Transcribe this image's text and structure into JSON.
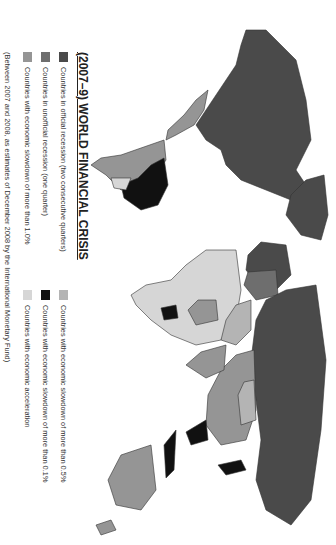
{
  "title": "(2007–9) WORLD FINANCIAL CRISIS",
  "orientation": "rotated 90° clockwise (north to the right)",
  "colors": {
    "official_recession": "#4a4a4a",
    "unofficial_recession": "#6e6e6e",
    "slowdown_1_0": "#959595",
    "slowdown_0_5": "#b4b4b4",
    "slowdown_0_1": "#111111",
    "acceleration": "#d6d6d6",
    "border": "#333333",
    "water": "#ffffff"
  },
  "legend": {
    "items": [
      {
        "label": "Countries in official recession (two consecutive quarters)",
        "color": "#4a4a4a"
      },
      {
        "label": "Countries in unofficial recession (one quarter)",
        "color": "#6e6e6e"
      },
      {
        "label": "Countries with economic slowdown of more than 1.0%",
        "color": "#959595"
      },
      {
        "label": "Countries with economic slowdown of more than 0.5%",
        "color": "#b4b4b4"
      },
      {
        "label": "Countries with economic slowdown of more than 0.1%",
        "color": "#111111"
      },
      {
        "label": "Countries with economic acceleration",
        "color": "#d6d6d6"
      }
    ],
    "note": "(Between 2007 and 2008, as estimates of December 2008 by the International Monetary Fund)"
  },
  "regions": [
    {
      "name": "North America (USA, Canada)",
      "category": "official_recession"
    },
    {
      "name": "Greenland",
      "category": "official_recession"
    },
    {
      "name": "Mexico",
      "category": "slowdown_1_0"
    },
    {
      "name": "Brazil",
      "category": "slowdown_0_1"
    },
    {
      "name": "Argentina / Chile",
      "category": "slowdown_1_0"
    },
    {
      "name": "Russia",
      "category": "official_recession"
    },
    {
      "name": "Western Europe",
      "category": "official_recession"
    },
    {
      "name": "Africa (most)",
      "category": "acceleration"
    },
    {
      "name": "China",
      "category": "slowdown_1_0"
    },
    {
      "name": "Mongolia",
      "category": "slowdown_0_5"
    },
    {
      "name": "India",
      "category": "slowdown_1_0"
    },
    {
      "name": "Southeast Asia / Indonesia",
      "category": "slowdown_0_1"
    },
    {
      "name": "Japan",
      "category": "slowdown_0_1"
    },
    {
      "name": "Australia",
      "category": "slowdown_1_0"
    }
  ]
}
